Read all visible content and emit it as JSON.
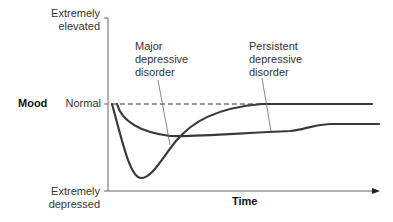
{
  "diagram": {
    "y_axis": {
      "title": "Mood",
      "tick_top": [
        "Extremely",
        "elevated"
      ],
      "tick_middle": "Normal",
      "tick_bottom": [
        "Extremely",
        "depressed"
      ]
    },
    "x_axis": {
      "title": "Time"
    },
    "curves": [
      {
        "name": "Major depressive disorder",
        "label_lines": [
          "Major",
          "depressive",
          "disorder"
        ],
        "description": "Sharp deep drop to extremely depressed, then recovery back to normal"
      },
      {
        "name": "Persistent depressive disorder",
        "label_lines": [
          "Persistent",
          "depressive",
          "disorder"
        ],
        "description": "Moderate drop that stays below normal over time"
      }
    ],
    "baseline": "Normal (dashed reference line)",
    "colors": {
      "curve": "#3a3a3a",
      "axis": "#555555",
      "leader": "#666666"
    }
  }
}
